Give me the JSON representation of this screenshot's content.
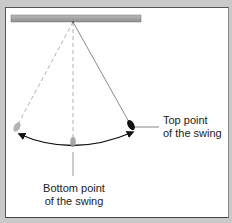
{
  "diagram": {
    "labels": {
      "top_point_line1": "Top point",
      "top_point_line2": "of the swing",
      "bottom_point_line1": "Bottom point",
      "bottom_point_line2": "of the swing"
    },
    "elements": {
      "ceiling_bar": "support bar",
      "pivot": "pivot point",
      "bob_left": "pendulum bob at left extreme",
      "bob_center": "pendulum bob at bottom",
      "bob_right": "pendulum bob at top point (right extreme)",
      "arc": "swing arc with arrows at both ends"
    },
    "colors": {
      "background": "#c9c9c9",
      "panel": "#ffffff",
      "bar": "#a8a8a8",
      "string": "#8a8a8a",
      "arc": "#111111",
      "bob_solid": "#111111",
      "bob_ghost": "#9a9a9a"
    }
  }
}
